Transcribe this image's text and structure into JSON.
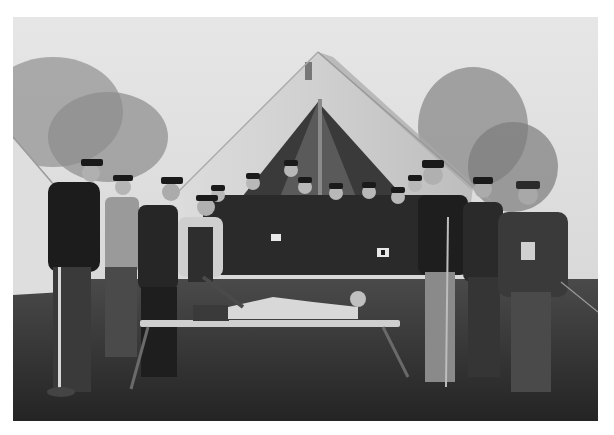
{
  "image": {
    "kind": "photograph",
    "tone": "black-and-white",
    "colors": {
      "page_background": "#ffffff",
      "sky": "#e2e2e2",
      "foliage": "#8a8a8a",
      "tent_canvas": "#d6d6d6",
      "tent_interior": "#3a3a3a",
      "uniform_dark": "#1e1e1e",
      "grass": "#2e2e2e",
      "stretcher": "#cfcfcf"
    }
  },
  "scene": {
    "elements": [
      "central-tent",
      "left-tent-edge",
      "trees",
      "group-of-soldiers",
      "stretcher-with-patient",
      "grass-ground"
    ]
  }
}
